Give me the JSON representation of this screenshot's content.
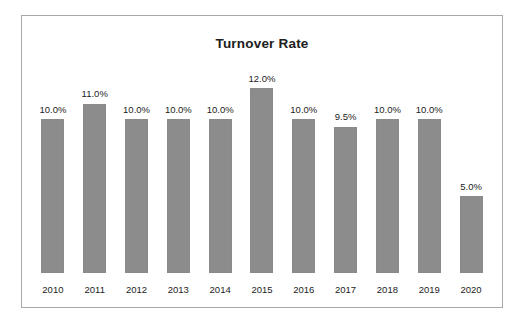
{
  "chart_data": {
    "type": "bar",
    "title": "Turnover Rate",
    "xlabel": "",
    "ylabel": "",
    "grid": false,
    "legend": false,
    "y_axis_visible": false,
    "ylim": [
      0,
      13.0
    ],
    "value_label_suffix": "%",
    "bar_color": "#8c8c8c",
    "frame_color": "#a8a8a8",
    "text_color": "#1c1c1c",
    "categories": [
      "2010",
      "2011",
      "2012",
      "2013",
      "2014",
      "2015",
      "2016",
      "2017",
      "2018",
      "2019",
      "2020"
    ],
    "values": [
      10.0,
      11.0,
      10.0,
      10.0,
      10.0,
      12.0,
      10.0,
      9.5,
      10.0,
      10.0,
      5.0
    ],
    "value_labels": [
      "10.0%",
      "11.0%",
      "10.0%",
      "10.0%",
      "10.0%",
      "12.0%",
      "10.0%",
      "9.5%",
      "10.0%",
      "10.0%",
      "5.0%"
    ],
    "points": [
      {
        "category": "2010",
        "value": 10.0,
        "label": "10.0%"
      },
      {
        "category": "2011",
        "value": 11.0,
        "label": "11.0%"
      },
      {
        "category": "2012",
        "value": 10.0,
        "label": "10.0%"
      },
      {
        "category": "2013",
        "value": 10.0,
        "label": "10.0%"
      },
      {
        "category": "2014",
        "value": 10.0,
        "label": "10.0%"
      },
      {
        "category": "2015",
        "value": 12.0,
        "label": "12.0%"
      },
      {
        "category": "2016",
        "value": 10.0,
        "label": "10.0%"
      },
      {
        "category": "2017",
        "value": 9.5,
        "label": "9.5%"
      },
      {
        "category": "2018",
        "value": 10.0,
        "label": "10.0%"
      },
      {
        "category": "2019",
        "value": 10.0,
        "label": "10.0%"
      },
      {
        "category": "2020",
        "value": 5.0,
        "label": "5.0%"
      }
    ]
  }
}
